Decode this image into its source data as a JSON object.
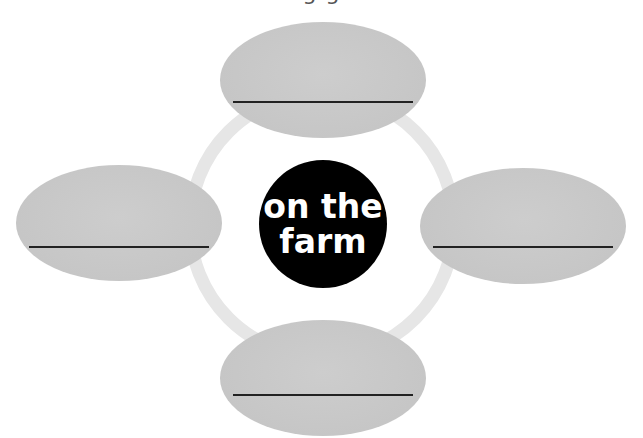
{
  "heading": {
    "text": "g                        g"
  },
  "diagram": {
    "center_label_line1": "on the",
    "center_label_line2": "farm",
    "colors": {
      "center_fill": "#000000",
      "center_text": "#ffffff",
      "oval_fill": "#c9c9c9",
      "ring": "#e4e4e4",
      "line": "#222222"
    },
    "ovals": [
      {
        "position": "top",
        "answer": ""
      },
      {
        "position": "left",
        "answer": ""
      },
      {
        "position": "right",
        "answer": ""
      },
      {
        "position": "bottom",
        "answer": ""
      }
    ]
  }
}
